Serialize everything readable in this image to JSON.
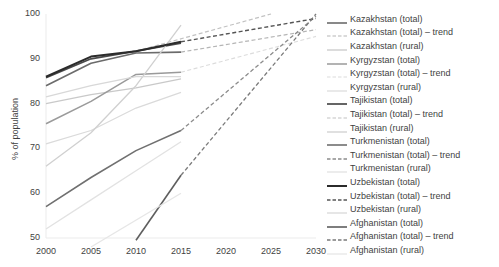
{
  "chart_data": {
    "type": "line",
    "title": "",
    "xlabel": "",
    "ylabel": "% of population",
    "xlim": [
      2000,
      2030
    ],
    "ylim": [
      50,
      100
    ],
    "xticks": [
      "2000",
      "2005",
      "2010",
      "2015",
      "2020",
      "2025",
      "2030"
    ],
    "yticks": [
      "50",
      "60",
      "70",
      "80",
      "90",
      "100"
    ],
    "grid": false,
    "legend_position": "right",
    "series": [
      {
        "name": "Kazakhstan (total)",
        "style": "solid",
        "color": "#6b6b6b",
        "width": 1.6,
        "x": [
          2000,
          2005,
          2010,
          2015
        ],
        "values": [
          84.0,
          89.0,
          91.3,
          91.5
        ]
      },
      {
        "name": "Kazakhstan (total) – trend",
        "style": "dashed",
        "color": "#b5b5b5",
        "width": 1.2,
        "x": [
          2015,
          2030
        ],
        "values": [
          91.5,
          96.5
        ]
      },
      {
        "name": "Kazakhstan (rural)",
        "style": "solid",
        "color": "#c9c9c9",
        "width": 1.3,
        "x": [
          2000,
          2005,
          2010,
          2015
        ],
        "values": [
          80.0,
          82.0,
          83.5,
          85.5
        ]
      },
      {
        "name": "Kyrgyzstan (total)",
        "style": "solid",
        "color": "#9a9a9a",
        "width": 1.5,
        "x": [
          2000,
          2005,
          2010,
          2015
        ],
        "values": [
          75.5,
          80.5,
          86.5,
          87.0
        ]
      },
      {
        "name": "Kyrgyzstan (total) – trend",
        "style": "dashed",
        "color": "#dcdcdc",
        "width": 1.1,
        "x": [
          2015,
          2030
        ],
        "values": [
          87.0,
          95.0
        ]
      },
      {
        "name": "Kyrgyzstan (rural)",
        "style": "solid",
        "color": "#dadada",
        "width": 1.2,
        "x": [
          2000,
          2005,
          2010,
          2015
        ],
        "values": [
          71.0,
          74.0,
          79.0,
          82.5
        ]
      },
      {
        "name": "Tajikistan (total)",
        "style": "solid",
        "color": "#4a4a4a",
        "width": 1.7,
        "x": [
          2000,
          2005,
          2010,
          2015
        ],
        "values": [
          85.8,
          90.0,
          91.7,
          93.5
        ]
      },
      {
        "name": "Tajikistan (total) – trend",
        "style": "dashed",
        "color": "#c2c2c2",
        "width": 1.2,
        "x": [
          2010,
          2025
        ],
        "values": [
          91.7,
          100.0
        ]
      },
      {
        "name": "Tajikistan (rural)",
        "style": "solid",
        "color": "#d0d0d0",
        "width": 1.3,
        "x": [
          2000,
          2005,
          2010,
          2015
        ],
        "values": [
          66.0,
          73.5,
          84.0,
          97.5
        ]
      },
      {
        "name": "Turkmenistan (total)",
        "style": "solid",
        "color": "#707070",
        "width": 1.6,
        "x": [
          2000,
          2005,
          2010,
          2015
        ],
        "values": [
          57.0,
          63.5,
          69.5,
          74.0
        ]
      },
      {
        "name": "Turkmenistan (total) – trend",
        "style": "dashed",
        "color": "#8c8c8c",
        "width": 1.3,
        "x": [
          2015,
          2030
        ],
        "values": [
          74.0,
          99.5
        ]
      },
      {
        "name": "Turkmenistan (rural)",
        "style": "solid",
        "color": "#e2e2e2",
        "width": 1.3,
        "x": [
          2000,
          2005,
          2010,
          2015
        ],
        "values": [
          52.0,
          58.5,
          65.0,
          71.5
        ]
      },
      {
        "name": "Uzbekistan (total)",
        "style": "solid",
        "color": "#2b2b2b",
        "width": 2.0,
        "x": [
          2000,
          2005,
          2010,
          2015
        ],
        "values": [
          86.0,
          90.5,
          91.7,
          93.8
        ]
      },
      {
        "name": "Uzbekistan (total) – trend",
        "style": "dashed",
        "color": "#555555",
        "width": 1.4,
        "x": [
          2015,
          2030
        ],
        "values": [
          93.8,
          99.0
        ]
      },
      {
        "name": "Uzbekistan (rural)",
        "style": "solid",
        "color": "#d8d8d8",
        "width": 1.3,
        "x": [
          2000,
          2005,
          2010,
          2015
        ],
        "values": [
          81.5,
          84.0,
          86.0,
          86.0
        ]
      },
      {
        "name": "Afghanistan (total)",
        "style": "solid",
        "color": "#5e5e5e",
        "width": 1.6,
        "x": [
          2010,
          2015
        ],
        "values": [
          49.5,
          64.0
        ]
      },
      {
        "name": "Afghanistan (total) – trend",
        "style": "dashed",
        "color": "#7a7a7a",
        "width": 1.3,
        "x": [
          2015,
          2030
        ],
        "values": [
          64.0,
          100.0
        ]
      },
      {
        "name": "Afghanistan (rural)",
        "style": "solid",
        "color": "#e6e6e6",
        "width": 1.3,
        "x": [
          2005,
          2015
        ],
        "values": [
          48.0,
          60.0
        ]
      }
    ]
  },
  "legend": {
    "items": [
      {
        "label": "Kazakhstan (total)",
        "style": "solid",
        "color": "#6b6b6b",
        "width": 1.6
      },
      {
        "label": "Kazakhstan (total) – trend",
        "style": "dashed",
        "color": "#b5b5b5",
        "width": 1.2
      },
      {
        "label": "Kazakhstan (rural)",
        "style": "solid",
        "color": "#c9c9c9",
        "width": 1.3
      },
      {
        "label": "Kyrgyzstan (total)",
        "style": "solid",
        "color": "#9a9a9a",
        "width": 1.5
      },
      {
        "label": "Kyrgyzstan (total) – trend",
        "style": "dashed",
        "color": "#dcdcdc",
        "width": 1.1
      },
      {
        "label": "Kyrgyzstan (rural)",
        "style": "solid",
        "color": "#dadada",
        "width": 1.2
      },
      {
        "label": "Tajikistan (total)",
        "style": "solid",
        "color": "#4a4a4a",
        "width": 1.7
      },
      {
        "label": "Tajikistan (total) – trend",
        "style": "dashed",
        "color": "#c2c2c2",
        "width": 1.2
      },
      {
        "label": "Tajikistan (rural)",
        "style": "solid",
        "color": "#d0d0d0",
        "width": 1.3
      },
      {
        "label": "Turkmenistan (total)",
        "style": "solid",
        "color": "#707070",
        "width": 1.6
      },
      {
        "label": "Turkmenistan (total) – trend",
        "style": "dashed",
        "color": "#8c8c8c",
        "width": 1.3
      },
      {
        "label": "Turkmenistan (rural)",
        "style": "solid",
        "color": "#e2e2e2",
        "width": 1.3
      },
      {
        "label": "Uzbekistan (total)",
        "style": "solid",
        "color": "#2b2b2b",
        "width": 2.0
      },
      {
        "label": "Uzbekistan (total) – trend",
        "style": "dashed",
        "color": "#555555",
        "width": 1.4
      },
      {
        "label": "Uzbekistan (rural)",
        "style": "solid",
        "color": "#d8d8d8",
        "width": 1.3
      },
      {
        "label": "Afghanistan (total)",
        "style": "solid",
        "color": "#5e5e5e",
        "width": 1.6
      },
      {
        "label": "Afghanistan (total) – trend",
        "style": "dashed",
        "color": "#7a7a7a",
        "width": 1.3
      },
      {
        "label": "Afghanistan (rural)",
        "style": "solid",
        "color": "#e6e6e6",
        "width": 1.3
      }
    ]
  }
}
